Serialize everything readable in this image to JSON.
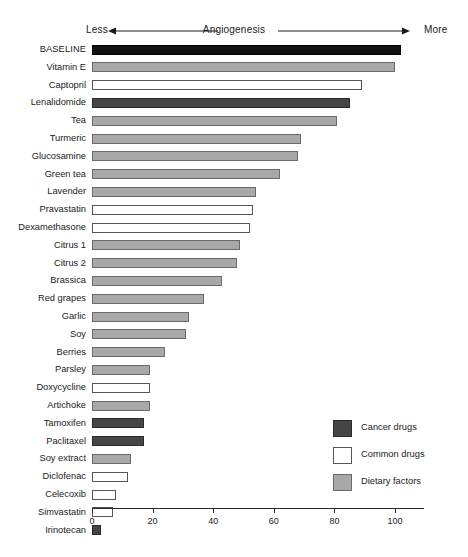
{
  "chart_data": {
    "type": "bar",
    "orientation": "horizontal",
    "title": "",
    "xlabel": "",
    "ylabel": "",
    "xlim": [
      0,
      110
    ],
    "grid": false,
    "ticks": [
      0,
      20,
      40,
      60,
      80,
      100
    ],
    "tick_labels": [
      "0",
      "20",
      "40",
      "60",
      "80",
      "100"
    ],
    "axis_direction": {
      "left_label": "Less",
      "center_label": "Angiogenesis",
      "right_label": "More"
    },
    "legend": {
      "position": "bottom-right",
      "entries": [
        {
          "label": "Cancer drugs",
          "key": "cancer",
          "color": "#454545"
        },
        {
          "label": "Common drugs",
          "key": "common",
          "color": "#ffffff"
        },
        {
          "label": "Dietary factors",
          "key": "dietary",
          "color": "#a8a8a8"
        }
      ]
    },
    "categories": [
      "BASELINE",
      "Vitamin E",
      "Captopril",
      "Lenalidomide",
      "Tea",
      "Turmeric",
      "Glucosamine",
      "Green tea",
      "Lavender",
      "Pravastatin",
      "Dexamethasone",
      "Citrus 1",
      "Citrus 2",
      "Brassica",
      "Red grapes",
      "Garlic",
      "Soy",
      "Berries",
      "Parsley",
      "Doxycycline",
      "Artichoke",
      "Tamoxifen",
      "Paclitaxel",
      "Soy extract",
      "Diclofenac",
      "Celecoxib",
      "Simvastatin",
      "Irinotecan"
    ],
    "values": [
      102,
      100,
      89,
      85,
      81,
      69,
      68,
      62,
      54,
      53,
      52,
      49,
      48,
      43,
      37,
      32,
      31,
      24,
      19,
      19,
      19,
      17,
      17,
      13,
      12,
      8,
      7,
      3
    ],
    "groups": [
      "baseline",
      "dietary",
      "common",
      "cancer",
      "dietary",
      "dietary",
      "dietary",
      "dietary",
      "dietary",
      "common",
      "common",
      "dietary",
      "dietary",
      "dietary",
      "dietary",
      "dietary",
      "dietary",
      "dietary",
      "dietary",
      "common",
      "dietary",
      "cancer",
      "cancer",
      "dietary",
      "common",
      "common",
      "common",
      "cancer"
    ]
  }
}
